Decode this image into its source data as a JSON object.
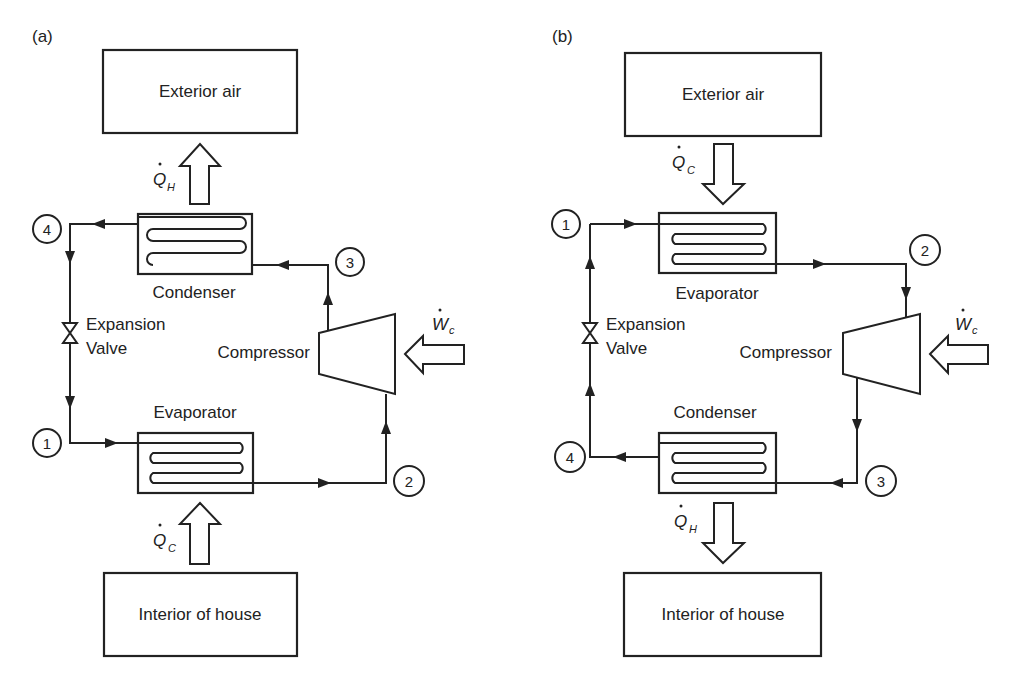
{
  "figure": {
    "panels": [
      {
        "id": "a",
        "label": "(a)",
        "top_box": "Exterior air",
        "bottom_box": "Interior of house",
        "top_exchanger": "Condenser",
        "bottom_exchanger": "Evaporator",
        "valve": [
          "Expansion",
          "Valve"
        ],
        "compressor": "Compressor",
        "heat_top": {
          "symbol": "Q",
          "sub": "H",
          "direction": "up"
        },
        "heat_bottom": {
          "symbol": "Q",
          "sub": "C",
          "direction": "up"
        },
        "work": {
          "symbol": "W",
          "sub": "c"
        },
        "nodes": [
          "1",
          "2",
          "3",
          "4"
        ]
      },
      {
        "id": "b",
        "label": "(b)",
        "top_box": "Exterior air",
        "bottom_box": "Interior of house",
        "top_exchanger": "Evaporator",
        "bottom_exchanger": "Condenser",
        "valve": [
          "Expansion",
          "Valve"
        ],
        "compressor": "Compressor",
        "heat_top": {
          "symbol": "Q",
          "sub": "C",
          "direction": "down"
        },
        "heat_bottom": {
          "symbol": "Q",
          "sub": "H",
          "direction": "down"
        },
        "work": {
          "symbol": "W",
          "sub": "c"
        },
        "nodes": [
          "1",
          "2",
          "3",
          "4"
        ]
      }
    ]
  },
  "colors": {
    "line": "#222222",
    "background": "#ffffff"
  }
}
